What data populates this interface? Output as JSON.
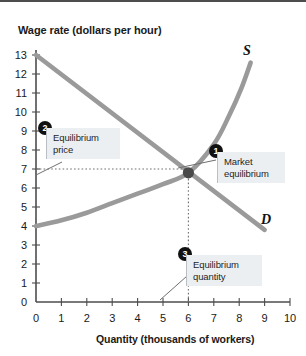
{
  "chart_data": {
    "type": "line",
    "title": "Wage rate (dollars per hour)",
    "xlabel": "Quantity (thousands of workers)",
    "ylabel": "Wage rate (dollars per hour)",
    "xlim": [
      0,
      10
    ],
    "ylim": [
      0,
      13
    ],
    "xticks": [
      "0",
      "1",
      "2",
      "3",
      "4",
      "5",
      "6",
      "7",
      "8",
      "9",
      "10"
    ],
    "yticks": [
      "0",
      "1",
      "2",
      "3",
      "4",
      "5",
      "6",
      "7",
      "8",
      "9",
      "10",
      "11",
      "12",
      "13"
    ],
    "grid": false,
    "legend": "inline-curve-labels",
    "series": [
      {
        "name": "S",
        "label": "S",
        "description": "Supply curve, upward sloping and convex",
        "color": "#9a9a9a",
        "points": [
          {
            "x": 0.0,
            "y": 4.0
          },
          {
            "x": 1.0,
            "y": 4.3
          },
          {
            "x": 2.0,
            "y": 4.7
          },
          {
            "x": 3.0,
            "y": 5.2
          },
          {
            "x": 4.0,
            "y": 5.7
          },
          {
            "x": 5.0,
            "y": 6.2
          },
          {
            "x": 6.0,
            "y": 6.8
          },
          {
            "x": 7.0,
            "y": 8.3
          },
          {
            "x": 7.6,
            "y": 9.8
          },
          {
            "x": 8.1,
            "y": 11.3
          },
          {
            "x": 8.45,
            "y": 12.6
          }
        ]
      },
      {
        "name": "D",
        "label": "D",
        "description": "Demand curve, downward sloping straight line",
        "color": "#9a9a9a",
        "points": [
          {
            "x": 0.0,
            "y": 13.0
          },
          {
            "x": 9.0,
            "y": 3.8
          }
        ]
      }
    ],
    "annotations": [
      {
        "id": "1",
        "label": "Market\nequilibrium",
        "target_x": 6.0,
        "target_y": 6.8
      },
      {
        "id": "2",
        "label": "Equilibrium\nprice",
        "target_x": 0.0,
        "target_y": 7.0
      },
      {
        "id": "3",
        "label": "Equilibrium\nquantity",
        "target_x": 6.0,
        "target_y": 0.0
      }
    ],
    "equilibrium": {
      "quantity": 6.0,
      "wage": 7.0,
      "marker_color": "#4a4a4a"
    },
    "guides": [
      {
        "type": "horizontal-dotted",
        "y": 7.0,
        "from_x": 0.0,
        "to_x": 6.0
      },
      {
        "type": "vertical-dotted",
        "x": 6.0,
        "from_y": 0.0,
        "to_y": 6.8
      }
    ],
    "colors": {
      "curve": "#9a9a9a",
      "axis": "#4d4d4d",
      "marker": "#4a4a4a",
      "callout_bg": "#eceff1",
      "badge_bg": "#111111"
    }
  },
  "axis_labels": {
    "y_title": "Wage rate (dollars per hour)",
    "x_title": "Quantity (thousands of workers)"
  },
  "curve_labels": {
    "supply": "S",
    "demand": "D"
  },
  "callouts": {
    "one": {
      "badge": "1",
      "text": "Market\nequilibrium"
    },
    "two": {
      "badge": "2",
      "text": "Equilibrium\nprice"
    },
    "three": {
      "badge": "3",
      "text": "Equilibrium\nquantity"
    }
  }
}
